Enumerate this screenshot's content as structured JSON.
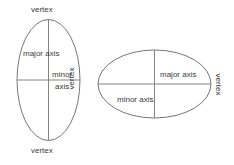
{
  "figure": {
    "stroke_color": "#666666",
    "text_color": "#3a3a3a",
    "background": "#ffffff",
    "ellipses": [
      {
        "name": "vertical-ellipse",
        "orientation": "vertical",
        "cx": 48.5,
        "cy": 80,
        "rx": 31.5,
        "ry": 60.5,
        "labels": {
          "vertex_top": "vertex",
          "vertex_bottom": "vertex",
          "major_axis": "major axis",
          "minor_axis_line1": "minor",
          "minor_axis_line2": "axis"
        }
      },
      {
        "name": "horizontal-ellipse",
        "orientation": "horizontal",
        "cx": 154.5,
        "cy": 84,
        "rx": 56.5,
        "ry": 34,
        "labels": {
          "vertex_left": "vertex",
          "vertex_right": "vertex",
          "major_axis": "major axis",
          "minor_axis": "minor axis"
        }
      }
    ]
  }
}
